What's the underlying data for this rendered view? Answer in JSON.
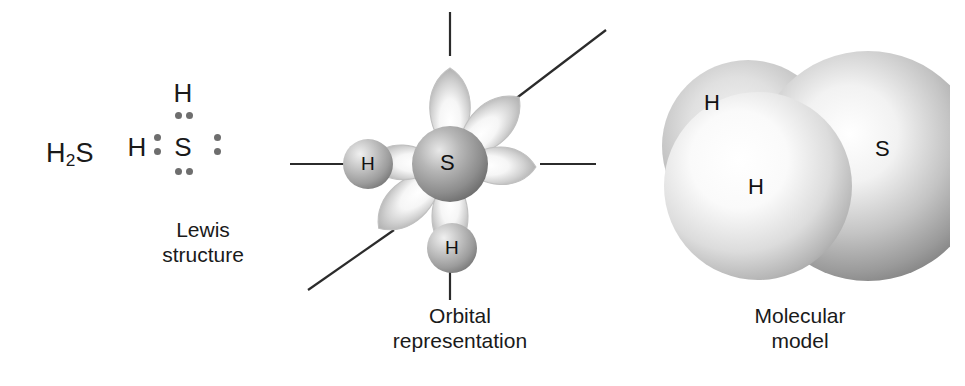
{
  "figure": {
    "background_color": "#ffffff",
    "text_color": "#1a1a1a"
  },
  "formula": {
    "element_symbol_1": "H",
    "subscript": "2",
    "element_symbol_2": "S"
  },
  "lewis": {
    "central_atom": "S",
    "hydrogen_top": "H",
    "hydrogen_left": "H",
    "dot_color": "#6e6e6e",
    "lone_pair_positions": [
      "top",
      "bottom",
      "right"
    ],
    "bonding_pair_positions": [
      "left",
      "top-bond"
    ],
    "caption": "Lewis\nstructure"
  },
  "orbital": {
    "central_atom": "S",
    "hydrogen_left": "H",
    "hydrogen_bottom": "H",
    "lobe_count": 6,
    "lobe_directions": [
      "up",
      "up-right",
      "right",
      "down",
      "down-left",
      "left"
    ],
    "axis_line_directions": [
      "up",
      "right",
      "left",
      "down",
      "up-right-diagonal",
      "down-left-diagonal"
    ],
    "sphere_color": "#9a9a9a",
    "lobe_color": "#c9c9c9",
    "axis_color": "#2b2b2b",
    "caption": "Orbital\nrepresentation"
  },
  "model": {
    "sulfur_label": "S",
    "hydrogen_front_label": "H",
    "hydrogen_back_label": "H",
    "sphere_style": "space-filling",
    "sulfur_color": "#b4b4b4",
    "hydrogen_color": "#d8d8d8",
    "caption": "Molecular\nmodel"
  }
}
